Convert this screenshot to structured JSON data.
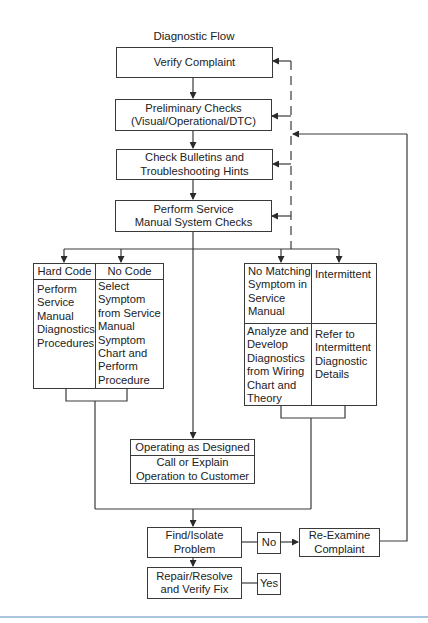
{
  "diagram": {
    "title": "Diagnostic Flow",
    "steps": {
      "verify_complaint": "Verify Complaint",
      "preliminary_checks": "Preliminary Checks\n(Visual/Operational/DTC)",
      "check_bulletins": "Check Bulletins and\nTroubleshooting Hints",
      "perform_service": "Perform Service\nManual System Checks"
    },
    "left_branch": {
      "hard_code_header": "Hard Code",
      "no_code_header": "No Code",
      "hard_code_body": "Perform\nService\nManual\nDiagnostics\nProcedures",
      "no_code_body": "Select\nSymptom\nfrom Service\nManual\nSymptom\nChart and\nPerform\nProcedure"
    },
    "right_branch": {
      "no_matching_header": "No Matching\nSymptom in\nService\nManual",
      "intermittent_header": "Intermittent",
      "no_matching_body": "Analyze and\nDevelop\nDiagnostics\nfrom Wiring\nChart and\nTheory",
      "intermittent_body": "Refer to\nIntermittent\nDiagnostic\nDetails"
    },
    "operating": {
      "header": "Operating as Designed",
      "body": "Call or Explain\nOperation to Customer"
    },
    "find_isolate": "Find/Isolate\nProblem",
    "repair_resolve": "Repair/Resolve\nand Verify Fix",
    "no_label": "No",
    "yes_label": "Yes",
    "re_examine": "Re-Examine\nComplaint"
  },
  "colors": {
    "line": "#3a3a3a",
    "bottom_rule": "#a9c4dc"
  }
}
